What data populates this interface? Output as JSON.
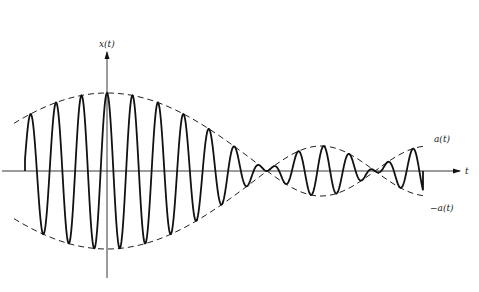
{
  "figure": {
    "y_axis_label": "x(t)",
    "x_axis_label": "t",
    "upper_envelope_label": "a(t)",
    "lower_envelope_label": "−a(t)"
  },
  "geometry": {
    "origin_x": 107,
    "origin_y": 171,
    "x_axis_start": 2,
    "x_axis_end": 460,
    "y_axis_top": 52,
    "y_axis_bottom": 278,
    "wave_start": 25,
    "wave_end": 423,
    "envelope_start": 14,
    "envelope_end": 425,
    "period": 25.5,
    "zero_crossing_1": 267,
    "zero_crossing_2": 375
  },
  "colors": {
    "ink": "#111111",
    "background": "#ffffff"
  }
}
